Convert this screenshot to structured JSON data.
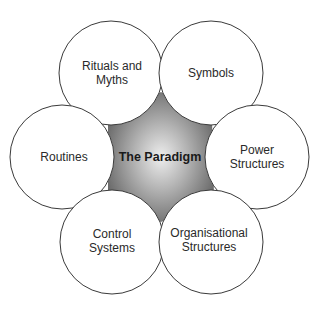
{
  "diagram": {
    "type": "cultural-web",
    "center": {
      "label": "The Paradigm",
      "cx": 160,
      "cy": 157
    },
    "colors": {
      "background": "#ffffff",
      "circle_fill": "#ffffff",
      "circle_stroke": "#3a3a3a",
      "center_light": "#e6e6e6",
      "center_dark": "#707070",
      "text": "#2a2a2a"
    },
    "nodes": [
      {
        "label": "Rituals and\nMyths",
        "cx": 111,
        "cy": 73,
        "r": 52
      },
      {
        "label": "Symbols",
        "cx": 211,
        "cy": 73,
        "r": 52
      },
      {
        "label": "Routines",
        "cx": 62,
        "cy": 157,
        "r": 52
      },
      {
        "label": "Power\nStructures",
        "cx": 257,
        "cy": 157,
        "r": 52
      },
      {
        "label": "Control\nSystems",
        "cx": 112,
        "cy": 242,
        "r": 52
      },
      {
        "label": "Organisational\nStructures",
        "cx": 211,
        "cy": 242,
        "r": 52
      }
    ]
  }
}
